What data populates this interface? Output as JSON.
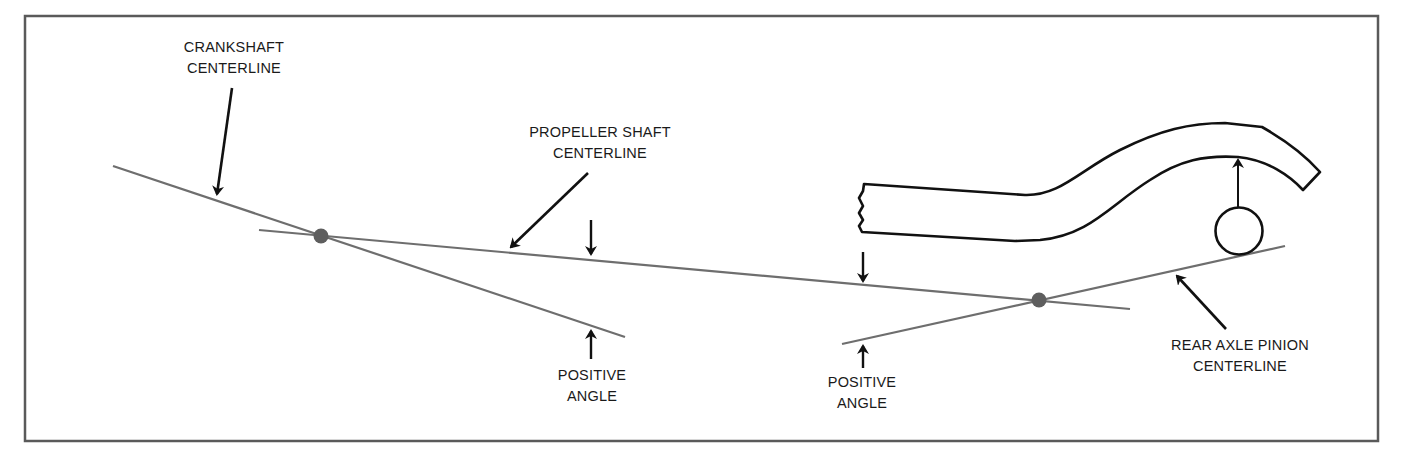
{
  "figure": {
    "colors": {
      "centerline": "#6e6e6e",
      "pivot_dot": "#5e5e5e",
      "outline": "#111111",
      "border": "#5a5a5a",
      "background": "#ffffff"
    }
  },
  "labels": {
    "crankshaft": {
      "line1": "CRANKSHAFT",
      "line2": "CENTERLINE"
    },
    "propeller": {
      "line1": "PROPELLER SHAFT",
      "line2": "CENTERLINE"
    },
    "positive_angle_left": {
      "line1": "POSITIVE",
      "line2": "ANGLE"
    },
    "positive_angle_right": {
      "line1": "POSITIVE",
      "line2": "ANGLE"
    },
    "rear_axle": {
      "line1": "REAR AXLE PINION",
      "line2": "CENTERLINE"
    }
  },
  "components": {
    "crankshaft_centerline": "crankshaft-centerline",
    "propeller_shaft_centerline": "propeller-shaft-centerline",
    "rear_axle_pinion_centerline": "rear-axle-pinion-centerline",
    "frame_rail": "vehicle-frame-rail",
    "axle_housing": "rear-axle-housing-circle",
    "front_universal_joint": "front-u-joint-pivot",
    "rear_universal_joint": "rear-u-joint-pivot"
  }
}
